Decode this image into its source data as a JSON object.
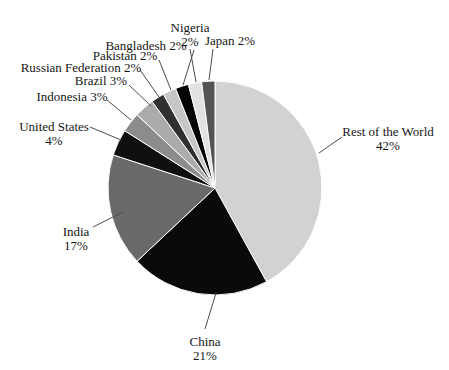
{
  "chart_data": {
    "type": "pie",
    "title": "",
    "legend": "none",
    "label_style": "outside-with-leader-lines",
    "start_angle_deg": 0,
    "direction": "clockwise",
    "background_color": "#ffffff",
    "slice_border_color": "#ffffff",
    "leader_line_color": "#4d4d4d",
    "text_color": "#161616",
    "center": {
      "x": 215,
      "y": 188
    },
    "radius": 107,
    "line_height": 14,
    "categories": [
      "Rest of the World",
      "China",
      "India",
      "United States",
      "Indonesia",
      "Brazil",
      "Russian Federation",
      "Pakistan",
      "Bangladesh",
      "Nigeria",
      "Japan"
    ],
    "values": [
      42,
      21,
      17,
      4,
      3,
      3,
      2,
      2,
      2,
      2,
      2
    ],
    "unit": "%",
    "slices": [
      {
        "label": "Rest of the World",
        "value": 42,
        "percent_text": "42%",
        "color": "#d2d2d2",
        "label_lines": [
          "Rest of the World",
          "42%"
        ],
        "label_x": 388,
        "label_y": 136,
        "leader": [
          342,
          137,
          319,
          153
        ]
      },
      {
        "label": "China",
        "value": 21,
        "percent_text": "21%",
        "color": "#0a0a0a",
        "label_lines": [
          "China",
          "21%"
        ],
        "label_x": 205,
        "label_y": 346,
        "leader": [
          205,
          329,
          216,
          293
        ]
      },
      {
        "label": "India",
        "value": 17,
        "percent_text": "17%",
        "color": "#696969",
        "label_lines": [
          "India",
          "17%"
        ],
        "label_x": 76,
        "label_y": 236,
        "leader": [
          93,
          227,
          123,
          212
        ]
      },
      {
        "label": "United States",
        "value": 4,
        "percent_text": "4%",
        "color": "#101010",
        "label_lines": [
          "United States",
          "4%"
        ],
        "label_x": 54,
        "label_y": 131,
        "leader": [
          90,
          127,
          121,
          140
        ]
      },
      {
        "label": "Indonesia",
        "value": 3,
        "percent_text": "3%",
        "color": "#8c8c8c",
        "label_lines": [
          "Indonesia 3%"
        ],
        "label_x": 72,
        "label_y": 101,
        "leader": [
          107,
          100,
          131,
          120
        ]
      },
      {
        "label": "Brazil",
        "value": 3,
        "percent_text": "3%",
        "color": "#ababab",
        "label_lines": [
          "Brazil 3%"
        ],
        "label_x": 101,
        "label_y": 85,
        "leader": [
          129,
          85,
          151,
          106
        ]
      },
      {
        "label": "Russian Federation",
        "value": 2,
        "percent_text": "2%",
        "color": "#303030",
        "label_lines": [
          "Russian Federation 2%"
        ],
        "label_x": 81,
        "label_y": 72,
        "leader": [
          140,
          70,
          159,
          97
        ]
      },
      {
        "label": "Pakistan",
        "value": 2,
        "percent_text": "2%",
        "color": "#c6c6c6",
        "label_lines": [
          "Pakistan 2%"
        ],
        "label_x": 125,
        "label_y": 60,
        "leader": [
          159,
          60,
          171,
          90
        ]
      },
      {
        "label": "Bangladesh",
        "value": 2,
        "percent_text": "2%",
        "color": "#040404",
        "label_lines": [
          "Bangladesh 2%"
        ],
        "label_x": 146,
        "label_y": 50,
        "leader": [
          194,
          50,
          183,
          85
        ]
      },
      {
        "label": "Nigeria",
        "value": 2,
        "percent_text": "2%",
        "color": "#e2e2e2",
        "label_lines": [
          "Nigeria",
          "2%"
        ],
        "label_x": 190,
        "label_y": 32,
        "leader": [
          190,
          49,
          196,
          82
        ]
      },
      {
        "label": "Japan",
        "value": 2,
        "percent_text": "2%",
        "color": "#545454",
        "label_lines": [
          "Japan 2%"
        ],
        "label_x": 230,
        "label_y": 45,
        "leader": [
          213,
          49,
          209,
          80
        ]
      }
    ]
  }
}
